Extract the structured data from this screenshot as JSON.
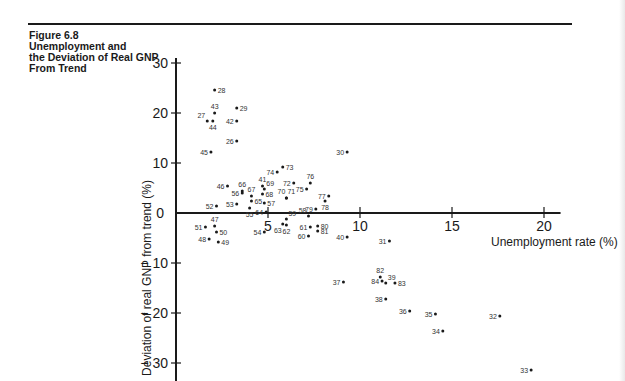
{
  "figure": {
    "caption": "Figure 6.8\nUnemployment and\nthe Deviation of Real GNP\nFrom Trend"
  },
  "chart_data": {
    "type": "scatter",
    "title": "Figure 6.8 Unemployment and the Deviation of Real GNP From Trend",
    "xlabel": "Unemployment rate (%)",
    "ylabel": "Deviation of real GNP from trend (%)",
    "xlim": [
      0,
      21
    ],
    "ylim": [
      -32,
      31
    ],
    "x_ticks": [
      5,
      10,
      15,
      20
    ],
    "y_ticks": [
      30,
      20,
      10,
      0,
      -10,
      -20,
      -30
    ],
    "y_tick_labels": [
      "30",
      "20",
      "10",
      "0",
      "− 10",
      "− 20",
      "− 30"
    ],
    "grid": false,
    "legend": null,
    "point_labels_note": "Each point labeled with two-digit year (19xx)",
    "points": [
      {
        "label": "26",
        "x": 3.3,
        "y": 14.4,
        "lp": "l"
      },
      {
        "label": "27",
        "x": 1.7,
        "y": 18.4,
        "lp": "la"
      },
      {
        "label": "28",
        "x": 2.1,
        "y": 24.6,
        "lp": "r"
      },
      {
        "label": "29",
        "x": 3.3,
        "y": 21.0,
        "lp": "r"
      },
      {
        "label": "30",
        "x": 9.3,
        "y": 12.2,
        "lp": "l"
      },
      {
        "label": "31",
        "x": 11.6,
        "y": -5.6,
        "lp": "l"
      },
      {
        "label": "32",
        "x": 17.6,
        "y": -20.6,
        "lp": "l"
      },
      {
        "label": "33",
        "x": 19.3,
        "y": -31.4,
        "lp": "l"
      },
      {
        "label": "34",
        "x": 14.5,
        "y": -23.6,
        "lp": "l"
      },
      {
        "label": "35",
        "x": 14.1,
        "y": -20.2,
        "lp": "l"
      },
      {
        "label": "36",
        "x": 12.7,
        "y": -19.6,
        "lp": "l"
      },
      {
        "label": "37",
        "x": 9.1,
        "y": -13.8,
        "lp": "l"
      },
      {
        "label": "38",
        "x": 11.4,
        "y": -17.2,
        "lp": "l"
      },
      {
        "label": "39",
        "x": 11.4,
        "y": -14.0,
        "lp": "ra"
      },
      {
        "label": "40",
        "x": 9.3,
        "y": -4.8,
        "lp": "l"
      },
      {
        "label": "41",
        "x": 4.7,
        "y": 5.4,
        "lp": "a"
      },
      {
        "label": "42",
        "x": 3.3,
        "y": 18.4,
        "lp": "l"
      },
      {
        "label": "43",
        "x": 2.1,
        "y": 20.0,
        "lp": "a"
      },
      {
        "label": "44",
        "x": 2.0,
        "y": 18.4,
        "lp": "b"
      },
      {
        "label": "45",
        "x": 1.9,
        "y": 12.2,
        "lp": "l"
      },
      {
        "label": "46",
        "x": 2.8,
        "y": 5.4,
        "lp": "l"
      },
      {
        "label": "47",
        "x": 2.1,
        "y": -2.6,
        "lp": "a"
      },
      {
        "label": "48",
        "x": 1.8,
        "y": -5.2,
        "lp": "l"
      },
      {
        "label": "49",
        "x": 2.3,
        "y": -5.8,
        "lp": "r"
      },
      {
        "label": "50",
        "x": 2.2,
        "y": -3.8,
        "lp": "r"
      },
      {
        "label": "51",
        "x": 1.6,
        "y": -2.8,
        "lp": "l"
      },
      {
        "label": "52",
        "x": 2.2,
        "y": 1.4,
        "lp": "l"
      },
      {
        "label": "53",
        "x": 3.3,
        "y": 1.8,
        "lp": "l"
      },
      {
        "label": "54",
        "x": 4.8,
        "y": -3.8,
        "lp": "l"
      },
      {
        "label": "55",
        "x": 4.0,
        "y": 1.0,
        "lp": "b"
      },
      {
        "label": "56",
        "x": 3.6,
        "y": 4.0,
        "lp": "l"
      },
      {
        "label": "57",
        "x": 4.8,
        "y": 2.0,
        "lp": "r"
      },
      {
        "label": "58",
        "x": 7.2,
        "y": -0.6,
        "lp": "la"
      },
      {
        "label": "59",
        "x": 6.0,
        "y": -1.2,
        "lp": "ra"
      },
      {
        "label": "60",
        "x": 7.2,
        "y": -4.6,
        "lp": "l"
      },
      {
        "label": "61",
        "x": 7.3,
        "y": -2.8,
        "lp": "l"
      },
      {
        "label": "62",
        "x": 6.0,
        "y": -2.4,
        "lp": "b"
      },
      {
        "label": "63",
        "x": 5.8,
        "y": -2.2,
        "lp": "bl"
      },
      {
        "label": "64",
        "x": 4.9,
        "y": 0.2,
        "lp": "l"
      },
      {
        "label": "65",
        "x": 4.1,
        "y": 2.4,
        "lp": "r"
      },
      {
        "label": "66",
        "x": 3.6,
        "y": 4.4,
        "lp": "a"
      },
      {
        "label": "67",
        "x": 4.1,
        "y": 3.4,
        "lp": "a"
      },
      {
        "label": "68",
        "x": 4.7,
        "y": 3.8,
        "lp": "r"
      },
      {
        "label": "69",
        "x": 4.8,
        "y": 4.8,
        "lp": "ra"
      },
      {
        "label": "70",
        "x": 6.0,
        "y": 3.0,
        "lp": "al"
      },
      {
        "label": "71",
        "x": 6.0,
        "y": 3.0,
        "lp": "ar"
      },
      {
        "label": "72",
        "x": 6.4,
        "y": 6.0,
        "lp": "l"
      },
      {
        "label": "73",
        "x": 5.8,
        "y": 9.2,
        "lp": "r"
      },
      {
        "label": "74",
        "x": 5.5,
        "y": 8.2,
        "lp": "l"
      },
      {
        "label": "75",
        "x": 7.1,
        "y": 4.8,
        "lp": "l"
      },
      {
        "label": "76",
        "x": 7.3,
        "y": 6.0,
        "lp": "a"
      },
      {
        "label": "77",
        "x": 8.3,
        "y": 3.4,
        "lp": "l"
      },
      {
        "label": "78",
        "x": 8.1,
        "y": 2.4,
        "lp": "b"
      },
      {
        "label": "79",
        "x": 7.6,
        "y": 0.8,
        "lp": "l"
      },
      {
        "label": "80",
        "x": 7.7,
        "y": -2.6,
        "lp": "r"
      },
      {
        "label": "81",
        "x": 7.7,
        "y": -3.6,
        "lp": "r"
      },
      {
        "label": "82",
        "x": 11.1,
        "y": -12.8,
        "lp": "a"
      },
      {
        "label": "83",
        "x": 11.9,
        "y": -14.0,
        "lp": "r"
      },
      {
        "label": "84",
        "x": 11.2,
        "y": -13.6,
        "lp": "l"
      }
    ]
  },
  "colors": {
    "ink": "#1a1a1a",
    "background": "#ffffff"
  }
}
